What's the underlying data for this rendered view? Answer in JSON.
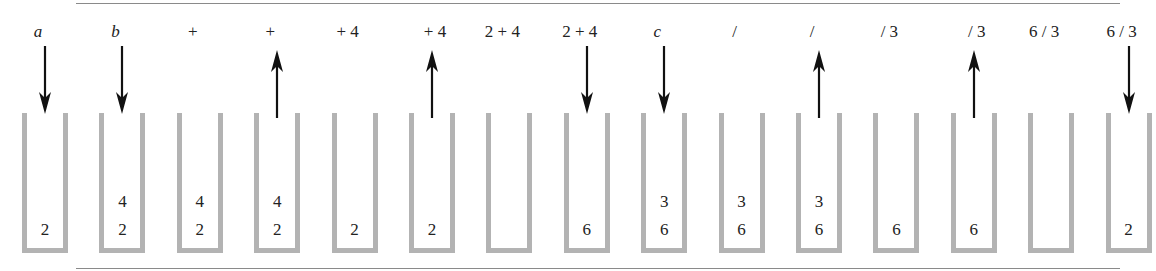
{
  "diagram": {
    "title": "",
    "rule_color": "#8a8a8a",
    "stack_color": "#b3b3b3",
    "arrow_color": "#111111",
    "legend": {
      "down_arrow": "push onto stack",
      "up_arrow": "pop from stack"
    },
    "frames": [
      {
        "label": "a",
        "italic": true,
        "arrow": "down",
        "stack": [
          "2"
        ]
      },
      {
        "label": "b",
        "italic": true,
        "arrow": "down",
        "stack": [
          "2",
          "4"
        ]
      },
      {
        "label": "+",
        "italic": false,
        "arrow": "none",
        "stack": [
          "2",
          "4"
        ]
      },
      {
        "label": "+",
        "italic": false,
        "arrow": "up",
        "stack": [
          "2",
          "4"
        ]
      },
      {
        "label": "+ 4",
        "italic": false,
        "arrow": "none",
        "stack": [
          "2"
        ]
      },
      {
        "label": "+ 4",
        "italic": false,
        "arrow": "up",
        "stack": [
          "2"
        ]
      },
      {
        "label": "2 + 4",
        "italic": false,
        "arrow": "none",
        "stack": []
      },
      {
        "label": "2 + 4",
        "italic": false,
        "arrow": "down",
        "stack": [
          "6"
        ]
      },
      {
        "label": "c",
        "italic": true,
        "arrow": "down",
        "stack": [
          "6",
          "3"
        ]
      },
      {
        "label": "/",
        "italic": false,
        "arrow": "none",
        "stack": [
          "6",
          "3"
        ]
      },
      {
        "label": "/",
        "italic": false,
        "arrow": "up",
        "stack": [
          "6",
          "3"
        ]
      },
      {
        "label": "/ 3",
        "italic": false,
        "arrow": "none",
        "stack": [
          "6"
        ]
      },
      {
        "label": "/ 3",
        "italic": false,
        "arrow": "up",
        "stack": [
          "6"
        ]
      },
      {
        "label": "6 / 3",
        "italic": false,
        "arrow": "none",
        "stack": []
      },
      {
        "label": "6 / 3",
        "italic": false,
        "arrow": "down",
        "stack": [
          "2"
        ]
      }
    ]
  }
}
